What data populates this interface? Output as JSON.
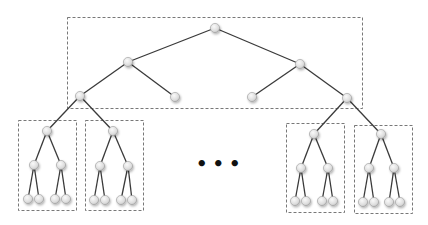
{
  "diagram": {
    "type": "binary-tree-decomposition",
    "ellipsis": "•••",
    "colors": {
      "edge": "#3a3a3a",
      "node_fill": "#e2e2e2",
      "node_stroke": "#9a9a9a",
      "box": "#555555"
    },
    "top_box": {
      "x": 67,
      "y": 17,
      "w": 295,
      "h": 91
    },
    "top_nodes": [
      {
        "id": "root",
        "x": 215,
        "y": 28
      },
      {
        "id": "l1a",
        "x": 128,
        "y": 62
      },
      {
        "id": "l1b",
        "x": 300,
        "y": 64
      },
      {
        "id": "l2a",
        "x": 80,
        "y": 96
      },
      {
        "id": "l2b",
        "x": 175,
        "y": 97
      },
      {
        "id": "l2c",
        "x": 252,
        "y": 97
      },
      {
        "id": "l2d",
        "x": 347,
        "y": 98
      }
    ],
    "top_edges": [
      [
        "root",
        "l1a"
      ],
      [
        "root",
        "l1b"
      ],
      [
        "l1a",
        "l2a"
      ],
      [
        "l1a",
        "l2b"
      ],
      [
        "l1b",
        "l2c"
      ],
      [
        "l1b",
        "l2d"
      ]
    ],
    "subtrees": [
      {
        "box": {
          "x": 18,
          "y": 120,
          "w": 58,
          "h": 90
        },
        "parent": "l2a",
        "root": {
          "x": 47,
          "y": 131
        },
        "mid": [
          {
            "x": 34,
            "y": 165
          },
          {
            "x": 61,
            "y": 165
          }
        ],
        "leaves": [
          {
            "x": 28,
            "y": 199
          },
          {
            "x": 39,
            "y": 199
          },
          {
            "x": 55,
            "y": 199
          },
          {
            "x": 66,
            "y": 199
          }
        ]
      },
      {
        "box": {
          "x": 85,
          "y": 120,
          "w": 58,
          "h": 90
        },
        "parent": "l2a",
        "root": {
          "x": 113,
          "y": 131
        },
        "mid": [
          {
            "x": 100,
            "y": 166
          },
          {
            "x": 128,
            "y": 166
          }
        ],
        "leaves": [
          {
            "x": 94,
            "y": 200
          },
          {
            "x": 105,
            "y": 200
          },
          {
            "x": 121,
            "y": 200
          },
          {
            "x": 132,
            "y": 200
          }
        ]
      },
      {
        "box": {
          "x": 286,
          "y": 123,
          "w": 58,
          "h": 89
        },
        "parent": "l2d",
        "root": {
          "x": 314,
          "y": 134
        },
        "mid": [
          {
            "x": 301,
            "y": 168
          },
          {
            "x": 328,
            "y": 168
          }
        ],
        "leaves": [
          {
            "x": 295,
            "y": 201
          },
          {
            "x": 306,
            "y": 201
          },
          {
            "x": 322,
            "y": 201
          },
          {
            "x": 333,
            "y": 201
          }
        ]
      },
      {
        "box": {
          "x": 354,
          "y": 125,
          "w": 58,
          "h": 88
        },
        "parent": "l2d",
        "root": {
          "x": 381,
          "y": 134
        },
        "mid": [
          {
            "x": 369,
            "y": 168
          },
          {
            "x": 394,
            "y": 168
          }
        ],
        "leaves": [
          {
            "x": 363,
            "y": 202
          },
          {
            "x": 374,
            "y": 202
          },
          {
            "x": 389,
            "y": 202
          },
          {
            "x": 400,
            "y": 202
          }
        ]
      }
    ]
  }
}
